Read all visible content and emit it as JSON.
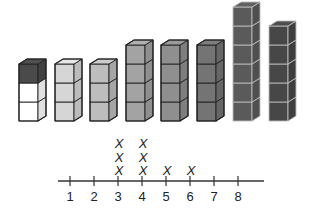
{
  "towers": [
    {
      "id": 1,
      "x": 19,
      "cubes": 3,
      "colors": [
        "#ffffff",
        "#ffffff",
        "#4a4a4a"
      ]
    },
    {
      "id": 2,
      "x": 55,
      "cubes": 3,
      "colors": [
        "#d6d6d6",
        "#d6d6d6",
        "#d6d6d6"
      ]
    },
    {
      "id": 3,
      "x": 90,
      "cubes": 3,
      "colors": [
        "#bdbdbd",
        "#bdbdbd",
        "#bdbdbd"
      ]
    },
    {
      "id": 4,
      "x": 126,
      "cubes": 4,
      "colors": [
        "#a3a3a3",
        "#a3a3a3",
        "#a3a3a3",
        "#a3a3a3"
      ]
    },
    {
      "id": 5,
      "x": 161,
      "cubes": 4,
      "colors": [
        "#8f8f8f",
        "#8f8f8f",
        "#8f8f8f",
        "#8f8f8f"
      ]
    },
    {
      "id": 6,
      "x": 197,
      "cubes": 4,
      "colors": [
        "#747474",
        "#747474",
        "#747474",
        "#747474"
      ]
    },
    {
      "id": 7,
      "x": 233,
      "cubes": 6,
      "colors": [
        "#5a5a5a",
        "#5a5a5a",
        "#5a5a5a",
        "#5a5a5a",
        "#5a5a5a",
        "#5a5a5a"
      ]
    },
    {
      "id": 8,
      "x": 269,
      "cubes": 5,
      "colors": [
        "#474747",
        "#474747",
        "#474747",
        "#474747",
        "#474747"
      ]
    }
  ],
  "line_plot": {
    "tick_labels": [
      "1",
      "2",
      "3",
      "4",
      "5",
      "6",
      "7",
      "8"
    ],
    "x_mark_symbol": "X",
    "counts": {
      "1": 0,
      "2": 0,
      "3": 3,
      "4": 3,
      "5": 1,
      "6": 1,
      "7": 0,
      "8": 0
    }
  },
  "chart_data": {
    "type": "line_plot",
    "title": "",
    "xlabel": "",
    "ylabel": "",
    "categories": [
      "1",
      "2",
      "3",
      "4",
      "5",
      "6",
      "7",
      "8"
    ],
    "values": [
      0,
      0,
      3,
      3,
      1,
      1,
      0,
      0
    ],
    "marker": "X",
    "tower_heights": [
      3,
      3,
      3,
      4,
      4,
      4,
      6,
      5
    ]
  }
}
